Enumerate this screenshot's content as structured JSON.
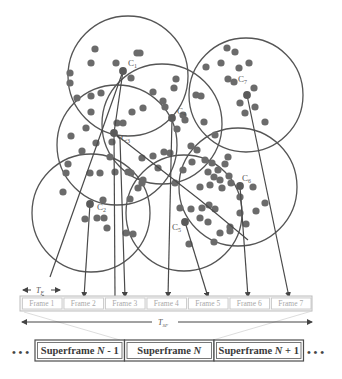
{
  "clusters": [
    {
      "id": "C1",
      "label_main": "C",
      "label_sub": "1",
      "target_frame": 1
    },
    {
      "id": "C2",
      "label_main": "C",
      "label_sub": "2",
      "target_frame": 2
    },
    {
      "id": "C3",
      "label_main": "C",
      "label_sub": "3",
      "target_frame": 3
    },
    {
      "id": "C4",
      "label_main": "C",
      "label_sub": "4",
      "target_frame": 4
    },
    {
      "id": "C5",
      "label_main": "C",
      "label_sub": "5",
      "target_frame": 5
    },
    {
      "id": "C6",
      "label_main": "C",
      "label_sub": "6",
      "target_frame": 6
    },
    {
      "id": "C7",
      "label_main": "C",
      "label_sub": "7",
      "target_frame": 7
    }
  ],
  "frames": [
    "Frame 1",
    "Frame 2",
    "Frame 3",
    "Frame 4",
    "Frame 5",
    "Frame 6",
    "Frame 7"
  ],
  "timing": {
    "frame_period": {
      "main": "T",
      "sub": "F"
    },
    "superframe_period": {
      "main": "T",
      "sub": "SF"
    }
  },
  "superframes": [
    {
      "label": "Superframe ",
      "var": "N",
      "suffix": " - 1"
    },
    {
      "label": "Superframe ",
      "var": "N",
      "suffix": ""
    },
    {
      "label": "Superframe ",
      "var": "N",
      "suffix": " + 1"
    }
  ],
  "ellipsis": "• • •"
}
